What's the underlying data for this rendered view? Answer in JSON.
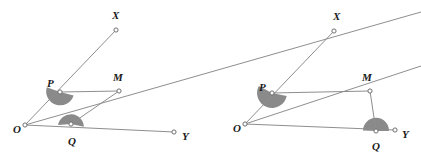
{
  "figure": {
    "background_color": "#ffffff",
    "line_color": "#8e8e8e",
    "shade_color": "#8a8a8a",
    "label_color": "#1a1a1a",
    "vertex_fill": "#ffffff",
    "width": 421,
    "height": 153
  },
  "diagrams": [
    {
      "id": "left-diagram",
      "name": "Diagram 1",
      "points": {
        "O": {
          "label": "O",
          "x": 25,
          "y": 125,
          "label_x": 13,
          "label_y": 133
        },
        "P": {
          "label": "P",
          "x": 60,
          "y": 92,
          "label_x": 47,
          "label_y": 87
        },
        "Q": {
          "label": "Q",
          "x": 71,
          "y": 124,
          "label_x": 68,
          "label_y": 145
        },
        "M": {
          "label": "M",
          "x": 119,
          "y": 91,
          "label_x": 113,
          "label_y": 81
        },
        "X": {
          "label": "X",
          "x": 116,
          "y": 30,
          "label_x": 112,
          "label_y": 19
        },
        "Y": {
          "label": "Y",
          "x": 174,
          "y": 132,
          "label_x": 182,
          "label_y": 140
        }
      },
      "rays": [
        {
          "name": "ray-OX",
          "from": "O",
          "to": "X"
        },
        {
          "name": "ray-OY",
          "from": "O",
          "to": "Y"
        },
        {
          "name": "ray-OM-extended",
          "from": "O",
          "through": "M",
          "end_x": 421,
          "end_y": 12
        }
      ],
      "segments": [
        {
          "name": "segment-PM",
          "from": "P",
          "to": "M"
        },
        {
          "name": "segment-QM",
          "from": "Q",
          "to": "M"
        }
      ],
      "angles": [
        {
          "name": "angle-at-P",
          "vertex": "P",
          "shaded": true,
          "radius": 14,
          "start_deg": -14,
          "end_deg": 160
        },
        {
          "name": "angle-at-Q",
          "vertex": "Q",
          "shaded": true,
          "radius": 13,
          "start_deg": 175,
          "end_deg": 352
        }
      ]
    },
    {
      "id": "right-diagram",
      "name": "Diagram 2",
      "points": {
        "O": {
          "label": "O",
          "x": 245,
          "y": 124,
          "label_x": 233,
          "label_y": 132
        },
        "P": {
          "label": "P",
          "x": 272,
          "y": 93,
          "label_x": 259,
          "label_y": 91
        },
        "Q": {
          "label": "Q",
          "x": 376,
          "y": 131,
          "label_x": 372,
          "label_y": 150
        },
        "M": {
          "label": "M",
          "x": 370,
          "y": 91,
          "label_x": 362,
          "label_y": 81
        },
        "X": {
          "label": "X",
          "x": 334,
          "y": 31,
          "label_x": 333,
          "label_y": 20
        },
        "Y": {
          "label": "Y",
          "x": 395,
          "y": 130,
          "label_x": 402,
          "label_y": 138
        }
      },
      "rays": [
        {
          "name": "ray-OX",
          "from": "O",
          "to": "X"
        },
        {
          "name": "ray-OY",
          "from": "O",
          "to": "Y"
        },
        {
          "name": "ray-OM-extended",
          "from": "O",
          "through": "M",
          "end_x": 421,
          "end_y": 66
        }
      ],
      "segments": [
        {
          "name": "segment-PM",
          "from": "P",
          "to": "M"
        },
        {
          "name": "segment-QM",
          "from": "Q",
          "to": "M"
        }
      ],
      "angles": [
        {
          "name": "angle-at-P",
          "vertex": "P",
          "shaded": true,
          "radius": 15,
          "start_deg": -12,
          "end_deg": 152
        },
        {
          "name": "angle-at-Q",
          "vertex": "Q",
          "shaded": true,
          "radius": 13,
          "start_deg": 182,
          "end_deg": 360
        }
      ]
    }
  ],
  "stray_lines": [
    {
      "name": "left-diagram-ray-overflow",
      "x1": 200,
      "y1": 45,
      "x2": 311,
      "y2": 12
    }
  ],
  "labels": {
    "O": "O",
    "P": "P",
    "Q": "Q",
    "M": "M",
    "X": "X",
    "Y": "Y"
  }
}
